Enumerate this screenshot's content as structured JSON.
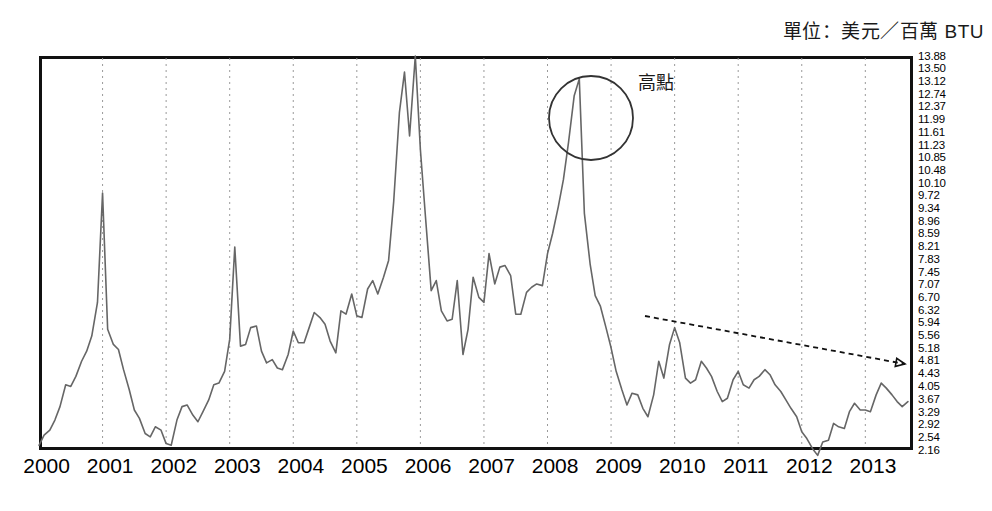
{
  "unit_title": "單位：美元／百萬 BTU",
  "annotations": {
    "peak_label": "高點",
    "peak_circle": {
      "cx": 591,
      "cy": 118,
      "r": 42
    },
    "trend_arrow": {
      "x1": 645,
      "y1": 316,
      "x2": 905,
      "y2": 364
    }
  },
  "colors": {
    "line": "#666666",
    "frame": "#111111",
    "grid": "#9a9a9a",
    "annotation": "#1a1a1a",
    "background": "#ffffff"
  },
  "chart_data": {
    "type": "line",
    "title": "單位：美元／百萬 BTU",
    "xlabel": "",
    "ylabel": "",
    "grid": "vertical-dotted-yearly",
    "legend": "none",
    "xlim": [
      2000.0,
      2013.75
    ],
    "ylim": [
      2.16,
      13.88
    ],
    "x_tick_labels": [
      "2000",
      "2001",
      "2002",
      "2003",
      "2004",
      "2005",
      "2006",
      "2007",
      "2008",
      "2009",
      "2010",
      "2011",
      "2012",
      "2013"
    ],
    "y_tick_labels": [
      "13.88",
      "13.50",
      "13.12",
      "12.74",
      "12.37",
      "11.99",
      "11.61",
      "11.23",
      "10.85",
      "10.48",
      "10.10",
      "9.72",
      "9.34",
      "8.96",
      "8.59",
      "8.21",
      "7.83",
      "7.45",
      "7.07",
      "6.70",
      "6.32",
      "5.94",
      "5.56",
      "5.18",
      "4.81",
      "4.43",
      "4.05",
      "3.67",
      "3.29",
      "2.92",
      "2.54",
      "2.16"
    ],
    "series": [
      {
        "name": "Natural Gas Price",
        "x": [
          2000.0,
          2000.08,
          2000.17,
          2000.25,
          2000.33,
          2000.42,
          2000.5,
          2000.58,
          2000.67,
          2000.75,
          2000.83,
          2000.92,
          2001.0,
          2001.08,
          2001.17,
          2001.25,
          2001.33,
          2001.42,
          2001.5,
          2001.58,
          2001.67,
          2001.75,
          2001.83,
          2001.92,
          2002.0,
          2002.08,
          2002.17,
          2002.25,
          2002.33,
          2002.42,
          2002.5,
          2002.58,
          2002.67,
          2002.75,
          2002.83,
          2002.92,
          2003.0,
          2003.08,
          2003.17,
          2003.25,
          2003.33,
          2003.42,
          2003.5,
          2003.58,
          2003.67,
          2003.75,
          2003.83,
          2003.92,
          2004.0,
          2004.08,
          2004.17,
          2004.25,
          2004.33,
          2004.42,
          2004.5,
          2004.58,
          2004.67,
          2004.75,
          2004.83,
          2004.92,
          2005.0,
          2005.08,
          2005.17,
          2005.25,
          2005.33,
          2005.42,
          2005.5,
          2005.58,
          2005.67,
          2005.75,
          2005.83,
          2005.92,
          2006.0,
          2006.08,
          2006.17,
          2006.25,
          2006.33,
          2006.42,
          2006.5,
          2006.58,
          2006.67,
          2006.75,
          2006.83,
          2006.92,
          2007.0,
          2007.08,
          2007.17,
          2007.25,
          2007.33,
          2007.42,
          2007.5,
          2007.58,
          2007.67,
          2007.75,
          2007.83,
          2007.92,
          2008.0,
          2008.08,
          2008.17,
          2008.25,
          2008.33,
          2008.42,
          2008.5,
          2008.58,
          2008.67,
          2008.75,
          2008.83,
          2008.92,
          2009.0,
          2009.08,
          2009.17,
          2009.25,
          2009.33,
          2009.42,
          2009.5,
          2009.58,
          2009.67,
          2009.75,
          2009.83,
          2009.92,
          2010.0,
          2010.08,
          2010.17,
          2010.25,
          2010.33,
          2010.42,
          2010.5,
          2010.58,
          2010.67,
          2010.75,
          2010.83,
          2010.92,
          2011.0,
          2011.08,
          2011.17,
          2011.25,
          2011.33,
          2011.42,
          2011.5,
          2011.58,
          2011.67,
          2011.75,
          2011.83,
          2011.92,
          2012.0,
          2012.08,
          2012.17,
          2012.25,
          2012.33,
          2012.42,
          2012.5,
          2012.58,
          2012.67,
          2012.75,
          2012.83,
          2012.92,
          2013.0,
          2013.08,
          2013.17,
          2013.25,
          2013.33,
          2013.42,
          2013.5,
          2013.58,
          2013.67
        ],
        "y": [
          2.3,
          2.6,
          2.75,
          3.05,
          3.45,
          4.1,
          4.05,
          4.35,
          4.8,
          5.1,
          5.55,
          6.55,
          9.8,
          5.75,
          5.3,
          5.15,
          4.55,
          3.95,
          3.35,
          3.1,
          2.65,
          2.55,
          2.85,
          2.75,
          2.35,
          2.3,
          3.05,
          3.45,
          3.5,
          3.2,
          3.0,
          3.3,
          3.65,
          4.1,
          4.15,
          4.5,
          5.45,
          8.2,
          5.25,
          5.3,
          5.8,
          5.85,
          5.1,
          4.75,
          4.85,
          4.6,
          4.55,
          5.0,
          5.7,
          5.35,
          5.35,
          5.8,
          6.25,
          6.1,
          5.9,
          5.4,
          5.05,
          6.3,
          6.2,
          6.8,
          6.15,
          6.1,
          6.95,
          7.2,
          6.8,
          7.3,
          7.8,
          9.55,
          12.2,
          13.4,
          11.5,
          13.88,
          11.1,
          9.1,
          6.9,
          7.2,
          6.3,
          6.0,
          6.05,
          7.2,
          5.0,
          5.75,
          7.3,
          6.7,
          6.55,
          8.0,
          7.1,
          7.6,
          7.65,
          7.35,
          6.2,
          6.2,
          6.85,
          7.0,
          7.1,
          7.05,
          8.0,
          8.6,
          9.4,
          10.2,
          11.3,
          12.7,
          13.2,
          9.2,
          7.7,
          6.75,
          6.45,
          5.8,
          5.2,
          4.5,
          3.95,
          3.5,
          3.85,
          3.8,
          3.4,
          3.15,
          3.8,
          4.8,
          4.3,
          5.3,
          5.8,
          5.35,
          4.3,
          4.15,
          4.25,
          4.8,
          4.6,
          4.35,
          3.9,
          3.6,
          3.7,
          4.25,
          4.5,
          4.1,
          4.0,
          4.25,
          4.35,
          4.55,
          4.4,
          4.1,
          3.9,
          3.65,
          3.4,
          3.15,
          2.7,
          2.5,
          2.2,
          2.0,
          2.4,
          2.45,
          2.95,
          2.85,
          2.8,
          3.3,
          3.55,
          3.35,
          3.35,
          3.3,
          3.8,
          4.15,
          4.0,
          3.8,
          3.6,
          3.45,
          3.6
        ]
      }
    ]
  }
}
